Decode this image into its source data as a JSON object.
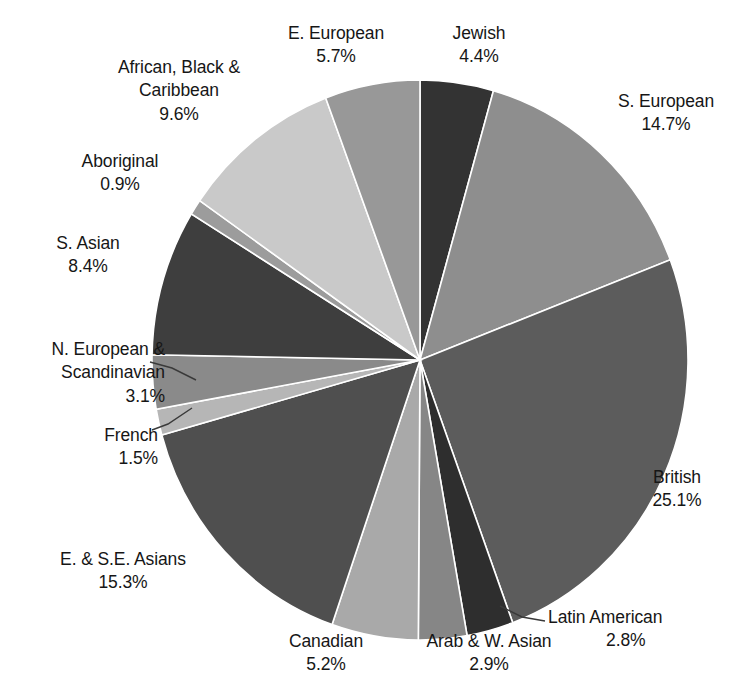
{
  "chart_data": {
    "type": "pie",
    "title": "",
    "subtitle": "",
    "xlabel": "",
    "ylabel": "",
    "legend_position": "none",
    "grid": false,
    "units": "percent",
    "start_angle_deg": 0,
    "direction": "clockwise",
    "categories": [
      "Jewish",
      "S. European",
      "British",
      "Latin American",
      "Arab & W. Asian",
      "Canadian",
      "E. & S.E. Asians",
      "French",
      "N. European & Scandinavian",
      "S. Asian",
      "Aboriginal",
      "African, Black & Caribbean",
      "E. European"
    ],
    "values": [
      4.4,
      14.7,
      25.1,
      2.8,
      2.9,
      5.2,
      15.3,
      1.5,
      3.1,
      8.4,
      0.9,
      9.6,
      5.7
    ],
    "colors": [
      "#333333",
      "#8e8e8e",
      "#5c5c5c",
      "#2e2e2e",
      "#868686",
      "#a9a9a9",
      "#4f4f4f",
      "#b6b6b6",
      "#8a8a8a",
      "#3e3e3e",
      "#9c9c9c",
      "#c9c9c9",
      "#989898"
    ],
    "slices": [
      {
        "label": "Jewish",
        "value": 4.4,
        "display": "4.4%",
        "color": "#333333"
      },
      {
        "label": "S. European",
        "value": 14.7,
        "display": "14.7%",
        "color": "#8e8e8e"
      },
      {
        "label": "British",
        "value": 25.1,
        "display": "25.1%",
        "color": "#5c5c5c"
      },
      {
        "label": "Latin American",
        "value": 2.8,
        "display": "2.8%",
        "color": "#2e2e2e"
      },
      {
        "label": "Arab & W. Asian",
        "value": 2.9,
        "display": "2.9%",
        "color": "#868686"
      },
      {
        "label": "Canadian",
        "value": 5.2,
        "display": "5.2%",
        "color": "#a9a9a9"
      },
      {
        "label": "E. & S.E. Asians",
        "value": 15.3,
        "display": "15.3%",
        "color": "#4f4f4f"
      },
      {
        "label": "French",
        "value": 1.5,
        "display": "1.5%",
        "color": "#b6b6b6"
      },
      {
        "label": "N. European & Scandinavian",
        "value": 3.1,
        "display": "3.1%",
        "color": "#8a8a8a"
      },
      {
        "label": "S. Asian",
        "value": 8.4,
        "display": "8.4%",
        "color": "#3e3e3e"
      },
      {
        "label": "Aboriginal",
        "value": 0.9,
        "display": "0.9%",
        "color": "#9c9c9c"
      },
      {
        "label": "African, Black & Caribbean",
        "value": 9.6,
        "display": "9.6%",
        "color": "#c9c9c9"
      },
      {
        "label": "E. European",
        "value": 5.7,
        "display": "5.7%",
        "color": "#989898"
      }
    ]
  },
  "labels": {
    "jewish": {
      "name": "Jewish",
      "pct": "4.4%"
    },
    "s_european": {
      "name": "S. European",
      "pct": "14.7%"
    },
    "british": {
      "name": "British",
      "pct": "25.1%"
    },
    "latin_american": {
      "name": "Latin American",
      "pct": "2.8%"
    },
    "arab": {
      "name": "Arab & W. Asian",
      "pct": "2.9%"
    },
    "canadian": {
      "name": "Canadian",
      "pct": "5.2%"
    },
    "e_se_asians": {
      "name": "E. & S.E. Asians",
      "pct": "15.3%"
    },
    "french": {
      "name": "French",
      "pct": "1.5%"
    },
    "n_european": {
      "name_line1": "N. European &",
      "name_line2": "Scandinavian",
      "pct": "3.1%"
    },
    "s_asian": {
      "name": "S. Asian",
      "pct": "8.4%"
    },
    "aboriginal": {
      "name": "Aboriginal",
      "pct": "0.9%"
    },
    "african": {
      "name_line1": "African, Black &",
      "name_line2": "Caribbean",
      "pct": "9.6%"
    },
    "e_european": {
      "name": "E. European",
      "pct": "5.7%"
    }
  },
  "geometry": {
    "center_x": 420,
    "center_y": 360,
    "radius_x": 268,
    "radius_y": 280
  },
  "style": {
    "slice_border": "#ffffff",
    "leader_line": "#3a3a3a",
    "background": "#ffffff",
    "text_color": "#161616"
  }
}
